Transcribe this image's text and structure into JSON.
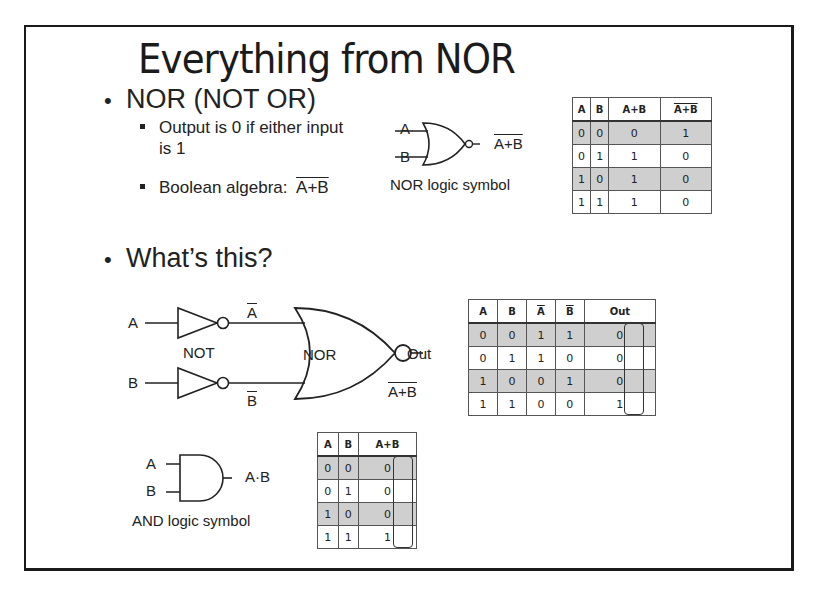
{
  "slide": {
    "title": "Everything from NOR",
    "bullet_nor": "NOR (NOT OR)",
    "sub1_line1": "Output is 0 if either input",
    "sub1_line2": "is 1",
    "sub2_prefix": "Boolean algebra:",
    "sub2_expr": "A+B",
    "bullet_whats": "What’s this?"
  },
  "nor_symbol": {
    "input_a": "A",
    "input_b": "B",
    "output": "A+B",
    "caption": "NOR logic symbol"
  },
  "nor_table": {
    "headers": [
      "A",
      "B",
      "A+B",
      "A+B"
    ],
    "rows": [
      [
        "0",
        "0",
        "0",
        "1"
      ],
      [
        "0",
        "1",
        "1",
        "0"
      ],
      [
        "1",
        "0",
        "1",
        "0"
      ],
      [
        "1",
        "1",
        "1",
        "0"
      ]
    ]
  },
  "circuit": {
    "input_a": "A",
    "input_b": "B",
    "not_a": "A",
    "not_b": "B",
    "not_label": "NOT",
    "nor_label": "NOR",
    "output": "Out",
    "expr_a": "A",
    "expr_plus": "+",
    "expr_b": "B"
  },
  "circuit_table": {
    "headers": [
      "A",
      "B",
      "A",
      "B",
      "Out"
    ],
    "rows": [
      [
        "0",
        "0",
        "1",
        "1",
        "0"
      ],
      [
        "0",
        "1",
        "1",
        "0",
        "0"
      ],
      [
        "1",
        "0",
        "0",
        "1",
        "0"
      ],
      [
        "1",
        "1",
        "0",
        "0",
        "1"
      ]
    ]
  },
  "and_symbol": {
    "input_a": "A",
    "input_b": "B",
    "output": "A·B",
    "caption": "AND logic symbol"
  },
  "and_table": {
    "headers": [
      "A",
      "B",
      "A+B"
    ],
    "rows": [
      [
        "0",
        "0",
        "0"
      ],
      [
        "0",
        "1",
        "0"
      ],
      [
        "1",
        "0",
        "0"
      ],
      [
        "1",
        "1",
        "1"
      ]
    ]
  },
  "colors": {
    "row_shade": "#cfcfcf",
    "border": "#1a1a1a"
  }
}
